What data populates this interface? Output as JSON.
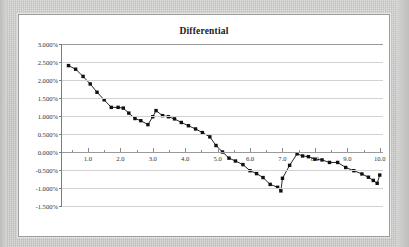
{
  "chart_data": {
    "type": "line",
    "title": "Differential",
    "xlabel": "",
    "ylabel": "",
    "ylim": [
      -0.015,
      0.03
    ],
    "xlim": [
      0.2,
      10.1
    ],
    "ytick_labels": [
      "3.000%",
      "2.500%",
      "2.000%",
      "1.500%",
      "1.000%",
      "0.500%",
      "0.000%",
      "-0.500%",
      "-1.000%",
      "-1.500%"
    ],
    "ytick_values": [
      0.03,
      0.025,
      0.02,
      0.015,
      0.01,
      0.005,
      0,
      -0.005,
      -0.01,
      -0.015
    ],
    "xtick_labels": [
      "1.0",
      "2.0",
      "3.0",
      "4.0",
      "5.0",
      "6.0",
      "7.0",
      "8.0",
      "9.0",
      "10.0"
    ],
    "xtick_values": [
      1,
      2,
      3,
      4,
      5,
      6,
      7,
      8,
      9,
      10
    ],
    "grid": "horizontal",
    "legend": "none",
    "marker": "square",
    "marker_color": "#101010",
    "line_color": "#101010",
    "series": [
      {
        "name": "Differential",
        "x": [
          0.4,
          0.62,
          0.85,
          1.07,
          1.28,
          1.5,
          1.72,
          1.93,
          2.09,
          2.26,
          2.45,
          2.63,
          2.85,
          3.0,
          3.1,
          3.3,
          3.48,
          3.67,
          3.88,
          4.1,
          4.32,
          4.53,
          4.76,
          4.95,
          5.15,
          5.35,
          5.55,
          5.78,
          6.0,
          6.2,
          6.4,
          6.62,
          6.85,
          6.95,
          7.0,
          7.22,
          7.45,
          7.62,
          7.8,
          8.0,
          8.22,
          8.45,
          8.7,
          8.95,
          9.2,
          9.45,
          9.65,
          9.8,
          9.92,
          10.0
        ],
        "y": [
          0.024,
          0.023,
          0.021,
          0.0189,
          0.0166,
          0.0145,
          0.0124,
          0.0124,
          0.0122,
          0.0108,
          0.0093,
          0.0087,
          0.0076,
          0.0098,
          0.0115,
          0.0101,
          0.0098,
          0.0092,
          0.0082,
          0.0073,
          0.0064,
          0.0054,
          0.0042,
          0.0018,
          0.0,
          -0.0017,
          -0.0025,
          -0.0035,
          -0.0052,
          -0.006,
          -0.0071,
          -0.009,
          -0.0098,
          -0.0108,
          -0.0073,
          -0.0037,
          -0.0005,
          -0.0011,
          -0.0013,
          -0.002,
          -0.0022,
          -0.0029,
          -0.0029,
          -0.0043,
          -0.0052,
          -0.0061,
          -0.007,
          -0.0079,
          -0.0087,
          -0.0064
        ]
      }
    ],
    "annotations": {
      "start_value": "2.400%",
      "local_min_x3": "0.760%",
      "local_peak_x3": "1.150%",
      "zero_crossing": "5.15",
      "global_min": "-1.080%",
      "end_value": "-0.640%"
    }
  }
}
